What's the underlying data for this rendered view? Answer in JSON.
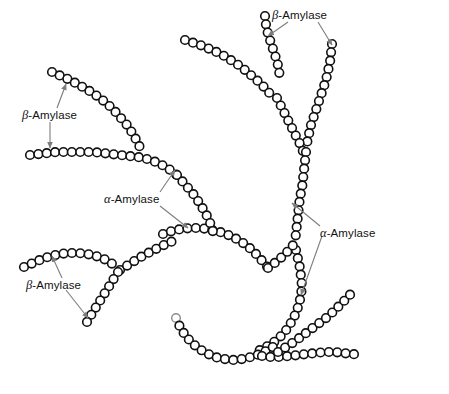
{
  "figure": {
    "type": "diagram",
    "background_color": "#ffffff",
    "residue_fill": "#ffffff",
    "residue_stroke": "#111111",
    "arrow_color": "#7d7d7d",
    "text_color": "#111111"
  },
  "labels": [
    {
      "id": "beta-top",
      "greek": "β",
      "text": "-Amylase",
      "full": "β-Amylase",
      "x": 272,
      "y": 8,
      "enzyme": "beta-amylase"
    },
    {
      "id": "beta-left",
      "greek": "β",
      "text": "-Amylase",
      "full": "β-Amylase",
      "x": 22,
      "y": 108,
      "enzyme": "beta-amylase"
    },
    {
      "id": "alpha-middle",
      "greek": "α",
      "text": "-Amylase",
      "full": "α-Amylase",
      "x": 104,
      "y": 192,
      "enzyme": "alpha-amylase"
    },
    {
      "id": "alpha-right",
      "greek": "α",
      "text": "-Amylase",
      "full": "α-Amylase",
      "x": 320,
      "y": 226,
      "enzyme": "alpha-amylase"
    },
    {
      "id": "beta-bottomleft",
      "greek": "β",
      "text": "-Amylase",
      "full": "β-Amylase",
      "x": 26,
      "y": 278,
      "enzyme": "beta-amylase"
    }
  ],
  "arrows": [
    {
      "id": "arrow-beta-top-left",
      "from": [
        288,
        22
      ],
      "to": [
        268,
        36
      ],
      "label": "beta-top"
    },
    {
      "id": "arrow-beta-top-right",
      "from": [
        318,
        22
      ],
      "to": [
        332,
        45
      ],
      "label": "beta-top"
    },
    {
      "id": "arrow-beta-left-up",
      "from": [
        57,
        108
      ],
      "to": [
        66,
        84
      ],
      "label": "beta-left"
    },
    {
      "id": "arrow-beta-left-down",
      "from": [
        50,
        122
      ],
      "to": [
        50,
        148
      ],
      "label": "beta-left"
    },
    {
      "id": "arrow-alpha-middle-up",
      "from": [
        160,
        192
      ],
      "to": [
        175,
        170
      ],
      "label": "alpha-middle"
    },
    {
      "id": "arrow-alpha-middle-down",
      "from": [
        160,
        206
      ],
      "to": [
        188,
        228
      ],
      "label": "alpha-middle"
    },
    {
      "id": "arrow-alpha-right-up",
      "from": [
        320,
        226
      ],
      "to": [
        292,
        203
      ],
      "label": "alpha-right"
    },
    {
      "id": "arrow-alpha-right-down",
      "from": [
        322,
        236
      ],
      "to": [
        301,
        295
      ],
      "label": "alpha-right"
    },
    {
      "id": "arrow-beta-bottomleft-up",
      "from": [
        62,
        278
      ],
      "to": [
        52,
        256
      ],
      "label": "beta-bottomleft"
    },
    {
      "id": "arrow-beta-bottomleft-down",
      "from": [
        66,
        290
      ],
      "to": [
        88,
        318
      ],
      "label": "beta-bottomleft"
    }
  ],
  "chains": [
    {
      "id": "chain-top-left-diagonal",
      "note": "upper-left arm descending to trunk branch point",
      "points": [
        [
          185,
          40
        ],
        [
          194,
          43
        ],
        [
          203,
          46
        ],
        [
          212,
          50
        ],
        [
          221,
          54
        ],
        [
          229,
          59
        ],
        [
          237,
          64
        ],
        [
          245,
          70
        ],
        [
          252,
          76
        ],
        [
          259,
          82
        ],
        [
          266,
          89
        ],
        [
          272,
          96
        ]
      ]
    },
    {
      "id": "chain-top-spur",
      "note": "short non-reducing end above upper branch",
      "points": [
        [
          265,
          16
        ],
        [
          266,
          25
        ],
        [
          268,
          34
        ],
        [
          271,
          43
        ],
        [
          274,
          52
        ],
        [
          277,
          61
        ],
        [
          279,
          70
        ],
        [
          280,
          79
        ]
      ]
    },
    {
      "id": "chain-top-right-arm",
      "note": "right non-reducing end descending to mid branch",
      "points": [
        [
          332,
          44
        ],
        [
          331,
          53
        ],
        [
          330,
          62
        ],
        [
          328,
          71
        ],
        [
          326,
          80
        ],
        [
          323,
          89
        ],
        [
          320,
          98
        ],
        [
          317,
          107
        ],
        [
          314,
          116
        ],
        [
          311,
          125
        ],
        [
          309,
          134
        ],
        [
          307,
          143
        ]
      ]
    },
    {
      "id": "chain-trunk-upper",
      "note": "main trunk from upper branch down to mid branch",
      "points": [
        [
          277,
          98
        ],
        [
          281,
          106
        ],
        [
          285,
          114
        ],
        [
          289,
          122
        ],
        [
          293,
          130
        ],
        [
          297,
          138
        ],
        [
          301,
          146
        ],
        [
          304,
          154
        ]
      ]
    },
    {
      "id": "chain-trunk-mid",
      "note": "trunk through alpha-amylase target region",
      "points": [
        [
          306,
          152
        ],
        [
          305,
          161
        ],
        [
          304,
          170
        ],
        [
          303,
          179
        ],
        [
          302,
          188
        ],
        [
          300,
          197
        ],
        [
          299,
          206
        ],
        [
          298,
          215
        ],
        [
          297,
          224
        ],
        [
          296,
          233
        ],
        [
          295,
          242
        ]
      ]
    },
    {
      "id": "chain-trunk-lower",
      "note": "trunk below lower branch curving down-left",
      "points": [
        [
          296,
          250
        ],
        [
          298,
          259
        ],
        [
          300,
          268
        ],
        [
          301,
          277
        ],
        [
          302,
          286
        ],
        [
          301,
          295
        ],
        [
          299,
          304
        ],
        [
          296,
          313
        ],
        [
          292,
          321
        ],
        [
          287,
          329
        ],
        [
          281,
          336
        ],
        [
          274,
          342
        ],
        [
          266,
          347
        ],
        [
          258,
          351
        ]
      ]
    },
    {
      "id": "chain-mid-arc",
      "note": "long horizontal arc joining trunk at lower branch",
      "points": [
        [
          163,
          234
        ],
        [
          172,
          231
        ],
        [
          181,
          229
        ],
        [
          190,
          228
        ],
        [
          199,
          228
        ],
        [
          208,
          229
        ],
        [
          217,
          231
        ],
        [
          226,
          234
        ],
        [
          235,
          238
        ],
        [
          243,
          243
        ],
        [
          251,
          249
        ],
        [
          258,
          256
        ],
        [
          264,
          263
        ],
        [
          270,
          270
        ]
      ]
    },
    {
      "id": "chain-arc-to-trunk",
      "note": "arc continues into trunk lower branch point",
      "points": [
        [
          268,
          268
        ],
        [
          276,
          262
        ],
        [
          283,
          256
        ],
        [
          289,
          250
        ],
        [
          294,
          244
        ]
      ]
    },
    {
      "id": "chain-upperleft-top",
      "note": "upper-left free non-reducing end",
      "points": [
        [
          52,
          72
        ],
        [
          61,
          76
        ],
        [
          70,
          80
        ],
        [
          79,
          85
        ],
        [
          88,
          90
        ],
        [
          97,
          96
        ],
        [
          105,
          102
        ],
        [
          113,
          109
        ],
        [
          120,
          117
        ],
        [
          127,
          125
        ],
        [
          133,
          134
        ],
        [
          138,
          143
        ],
        [
          142,
          152
        ]
      ]
    },
    {
      "id": "chain-left-horizontal",
      "note": "horizontal chain targeted by beta-amylase on left",
      "points": [
        [
          30,
          155
        ],
        [
          39,
          154
        ],
        [
          48,
          153
        ],
        [
          57,
          152
        ],
        [
          66,
          152
        ],
        [
          75,
          152
        ],
        [
          84,
          152
        ],
        [
          93,
          152
        ],
        [
          102,
          153
        ],
        [
          111,
          154
        ],
        [
          120,
          155
        ],
        [
          129,
          156
        ],
        [
          138,
          157
        ],
        [
          147,
          159
        ],
        [
          156,
          162
        ],
        [
          164,
          166
        ],
        [
          172,
          171
        ],
        [
          179,
          177
        ]
      ]
    },
    {
      "id": "chain-left-to-mid",
      "note": "descends from left horizontal toward mid arc",
      "points": [
        [
          177,
          175
        ],
        [
          183,
          182
        ],
        [
          189,
          189
        ],
        [
          195,
          196
        ],
        [
          200,
          204
        ],
        [
          205,
          212
        ],
        [
          209,
          220
        ],
        [
          212,
          228
        ],
        [
          214,
          236
        ]
      ]
    },
    {
      "id": "chain-lower-left-arc",
      "note": "lower-left arc ending in free non-reducing end",
      "points": [
        [
          24,
          267
        ],
        [
          33,
          263
        ],
        [
          42,
          259
        ],
        [
          51,
          256
        ],
        [
          60,
          254
        ],
        [
          69,
          253
        ],
        [
          78,
          253
        ],
        [
          87,
          254
        ],
        [
          96,
          256
        ],
        [
          104,
          259
        ],
        [
          111,
          263
        ],
        [
          118,
          268
        ]
      ]
    },
    {
      "id": "chain-lower-left-up",
      "note": "ascending arm from lower-left branch to mid arc",
      "points": [
        [
          120,
          270
        ],
        [
          128,
          265
        ],
        [
          136,
          260
        ],
        [
          144,
          255
        ],
        [
          152,
          251
        ],
        [
          160,
          247
        ],
        [
          168,
          243
        ],
        [
          176,
          240
        ]
      ]
    },
    {
      "id": "chain-lower-left-down",
      "note": "descending free end below lower-left branch",
      "points": [
        [
          118,
          272
        ],
        [
          113,
          280
        ],
        [
          108,
          288
        ],
        [
          103,
          296
        ],
        [
          98,
          304
        ],
        [
          93,
          312
        ],
        [
          88,
          320
        ],
        [
          84,
          328
        ]
      ]
    },
    {
      "id": "chain-bottom-u",
      "note": "bottom U-shaped free chain with open reducing end",
      "points": [
        [
          176,
          318
        ],
        [
          180,
          327
        ],
        [
          185,
          335
        ],
        [
          191,
          342
        ],
        [
          198,
          348
        ],
        [
          206,
          353
        ],
        [
          215,
          357
        ],
        [
          224,
          359
        ],
        [
          233,
          360
        ],
        [
          242,
          359
        ],
        [
          251,
          357
        ],
        [
          260,
          354
        ],
        [
          268,
          350
        ],
        [
          276,
          345
        ]
      ]
    },
    {
      "id": "chain-bottom-horizontal",
      "note": "bottom-right horizontal chain",
      "points": [
        [
          262,
          356
        ],
        [
          271,
          357
        ],
        [
          280,
          357
        ],
        [
          289,
          356
        ],
        [
          298,
          355
        ],
        [
          307,
          354
        ],
        [
          316,
          353
        ],
        [
          325,
          352
        ],
        [
          334,
          352
        ],
        [
          343,
          353
        ],
        [
          352,
          354
        ],
        [
          361,
          355
        ]
      ]
    },
    {
      "id": "chain-bottom-right-up",
      "note": "bottom-right ascending free end",
      "points": [
        [
          278,
          352
        ],
        [
          286,
          347
        ],
        [
          294,
          342
        ],
        [
          302,
          336
        ],
        [
          310,
          330
        ],
        [
          318,
          324
        ],
        [
          326,
          318
        ],
        [
          334,
          311
        ],
        [
          341,
          304
        ],
        [
          348,
          297
        ],
        [
          354,
          290
        ]
      ]
    }
  ]
}
